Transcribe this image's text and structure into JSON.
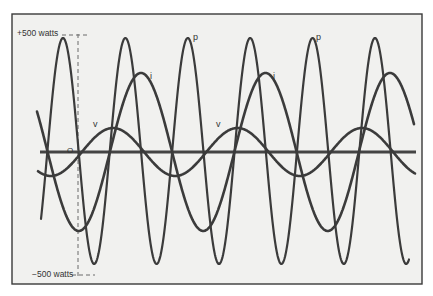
{
  "chart_data": {
    "type": "line",
    "title": "",
    "xlabel": "",
    "ylabel": "",
    "ylim": [
      -500,
      500
    ],
    "grid": false,
    "legend": "inline labels",
    "axis_labels": {
      "top": "+500 watts",
      "bottom": "−500 watts",
      "origin": "O"
    },
    "series": [
      {
        "name": "p",
        "description": "instantaneous power",
        "amplitude_px": 113,
        "offset_px": -1,
        "period_px": 62.4,
        "peak_x_px": 63,
        "peak_label_positions": [
          [
            193,
            40
          ],
          [
            316,
            40
          ]
        ]
      },
      {
        "name": "i",
        "description": "current",
        "amplitude_px": 79,
        "offset_px": 0,
        "period_px": 124.5,
        "peak_x_px": 141,
        "peak_label_positions": [
          [
            149,
            79
          ],
          [
            272,
            79
          ]
        ]
      },
      {
        "name": "v",
        "description": "voltage",
        "amplitude_px": 24,
        "offset_px": 0,
        "period_px": 124.5,
        "peak_x_px": 113,
        "peak_label_positions": [
          [
            93,
            128
          ],
          [
            216,
            128
          ]
        ]
      }
    ],
    "pixel_mapping": {
      "baseline_y": 152,
      "plus500_y": 36,
      "minus500_y": 262,
      "x_start": 37,
      "x_end": 416
    }
  },
  "labels": {
    "plus": "+500 watts",
    "minus": "−500 watts",
    "origin": "O",
    "p": "p",
    "i": "i",
    "v": "v"
  }
}
